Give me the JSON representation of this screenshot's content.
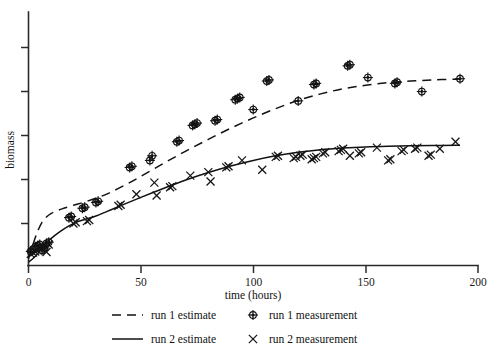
{
  "chart_data": {
    "type": "scatter",
    "title": "",
    "xlabel": "time (hours)",
    "ylabel": "biomass",
    "xlim": [
      0,
      200
    ],
    "ylim": [
      0,
      1.06
    ],
    "grid": false,
    "xticks": [
      0,
      50,
      100,
      150,
      200
    ],
    "xticklabels": [
      "0",
      "50",
      "100",
      "150",
      "200"
    ],
    "yticks": [
      0,
      0.2,
      0.4,
      0.6,
      0.8,
      1.0
    ],
    "yticklabels": [
      "0",
      "",
      "",
      "",
      "",
      ""
    ],
    "legend_position": "below-axes",
    "series": [
      {
        "name": "run 1 estimate",
        "type": "line",
        "style": "dashed",
        "x": [
          0,
          2,
          4,
          6,
          8,
          10,
          13,
          16,
          20,
          25,
          30,
          35,
          40,
          45,
          50,
          60,
          70,
          80,
          90,
          100,
          110,
          120,
          130,
          140,
          150,
          160,
          170,
          180,
          190,
          192
        ],
        "y": [
          0.03,
          0.09,
          0.145,
          0.185,
          0.208,
          0.222,
          0.236,
          0.246,
          0.258,
          0.272,
          0.288,
          0.307,
          0.33,
          0.355,
          0.382,
          0.437,
          0.49,
          0.54,
          0.588,
          0.632,
          0.672,
          0.707,
          0.735,
          0.757,
          0.772,
          0.783,
          0.79,
          0.795,
          0.798,
          0.799
        ]
      },
      {
        "name": "run 2 estimate",
        "type": "line",
        "style": "solid",
        "x": [
          0,
          2,
          4,
          6,
          8,
          10,
          14,
          18,
          22,
          26,
          30,
          35,
          40,
          50,
          60,
          70,
          80,
          90,
          100,
          110,
          120,
          130,
          140,
          150,
          160,
          170,
          180,
          190,
          192
        ],
        "y": [
          0.015,
          0.03,
          0.05,
          0.072,
          0.095,
          0.115,
          0.145,
          0.17,
          0.188,
          0.2,
          0.212,
          0.232,
          0.252,
          0.292,
          0.33,
          0.366,
          0.398,
          0.426,
          0.45,
          0.47,
          0.485,
          0.496,
          0.503,
          0.508,
          0.511,
          0.513,
          0.514,
          0.515,
          0.515
        ]
      },
      {
        "name": "run 1 measurement",
        "type": "scatter",
        "marker": "circle-plus",
        "x": [
          1,
          2,
          3,
          4,
          5,
          6,
          7,
          8,
          9,
          18,
          19,
          24,
          25,
          30,
          31,
          45,
          46,
          54,
          55,
          66,
          67,
          73,
          74,
          75,
          83,
          84,
          92,
          93,
          94,
          100,
          106,
          107,
          120,
          127,
          128,
          142,
          143,
          151,
          163,
          164,
          175,
          192
        ],
        "y": [
          0.06,
          0.07,
          0.08,
          0.085,
          0.09,
          0.065,
          0.075,
          0.095,
          0.1,
          0.205,
          0.21,
          0.245,
          0.25,
          0.27,
          0.275,
          0.42,
          0.425,
          0.45,
          0.47,
          0.53,
          0.535,
          0.6,
          0.605,
          0.61,
          0.62,
          0.625,
          0.71,
          0.715,
          0.72,
          0.668,
          0.79,
          0.795,
          0.705,
          0.775,
          0.78,
          0.855,
          0.86,
          0.805,
          0.78,
          0.785,
          0.745,
          0.8
        ]
      },
      {
        "name": "run 2 measurement",
        "type": "scatter",
        "marker": "x",
        "x": [
          1,
          2,
          3,
          4,
          5,
          6,
          7,
          8,
          9,
          20,
          21,
          26,
          27,
          40,
          41,
          48,
          56,
          57,
          63,
          64,
          72,
          80,
          81,
          88,
          89,
          95,
          104,
          110,
          111,
          118,
          119,
          121,
          122,
          126,
          127,
          128,
          131,
          132,
          138,
          139,
          140,
          143,
          147,
          148,
          155,
          160,
          161,
          166,
          167,
          172,
          173,
          178,
          179,
          183,
          190
        ],
        "y": [
          0.05,
          0.055,
          0.06,
          0.065,
          0.07,
          0.075,
          0.08,
          0.058,
          0.09,
          0.18,
          0.185,
          0.19,
          0.195,
          0.255,
          0.26,
          0.305,
          0.355,
          0.3,
          0.335,
          0.34,
          0.385,
          0.4,
          0.36,
          0.42,
          0.425,
          0.45,
          0.41,
          0.465,
          0.47,
          0.46,
          0.465,
          0.47,
          0.475,
          0.455,
          0.46,
          0.465,
          0.48,
          0.485,
          0.49,
          0.495,
          0.5,
          0.47,
          0.48,
          0.485,
          0.505,
          0.45,
          0.455,
          0.49,
          0.495,
          0.5,
          0.505,
          0.47,
          0.475,
          0.5,
          0.53
        ]
      }
    ]
  },
  "axes": {
    "xlabel": "time (hours)",
    "ylabel": "biomass",
    "xticklabels": [
      "0",
      "50",
      "100",
      "150",
      "200"
    ],
    "origin_label": "0"
  },
  "legend": {
    "entries": [
      {
        "label": "run 1 estimate",
        "marker": "dashed-line"
      },
      {
        "label": "run 1 measurement",
        "marker": "circle-plus"
      },
      {
        "label": "run 2 estimate",
        "marker": "solid-line"
      },
      {
        "label": "run 2 measurement",
        "marker": "x"
      }
    ]
  },
  "colors": {
    "ink": "#141414",
    "axis": "#2b2b2b",
    "background": "#ffffff"
  }
}
